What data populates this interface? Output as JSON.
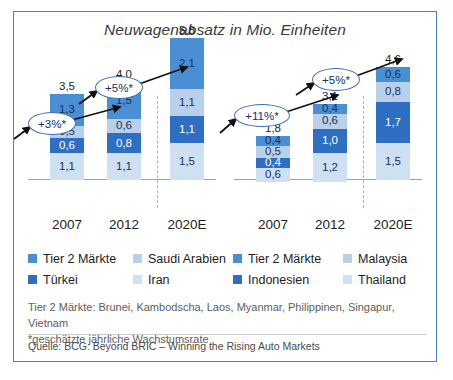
{
  "title": "Neuwagenabsatz in Mio. Einheiten",
  "colors": {
    "tier2": "#4a8fd4",
    "saudi": "#b9d0ea",
    "turkei": "#2e6fc4",
    "iran": "#cfe0f2",
    "tier2_r": "#4a8fd4",
    "malaysia": "#b9d0ea",
    "indonesien": "#2e6fc4",
    "thailand": "#cfe0f2",
    "frame": "#4f7fc0",
    "callout_border": "#3c6fb8"
  },
  "legend": {
    "columns": [
      {
        "items": [
          {
            "label": "Tier 2 Märkte",
            "color": "#4a8fd4"
          },
          {
            "label": "Türkei",
            "color": "#2e6fc4"
          }
        ]
      },
      {
        "items": [
          {
            "label": "Saudi Arabien",
            "color": "#b9d0ea"
          },
          {
            "label": "Iran",
            "color": "#cfe0f2"
          }
        ]
      },
      {
        "items": [
          {
            "label": "Tier 2 Märkte",
            "color": "#4a8fd4"
          },
          {
            "label": "Indonesien",
            "color": "#2e6fc4"
          }
        ]
      },
      {
        "items": [
          {
            "label": "Malaysia",
            "color": "#b9d0ea"
          },
          {
            "label": "Thailand",
            "color": "#cfe0f2"
          }
        ]
      }
    ]
  },
  "notes": {
    "line1": "Tier 2 Märkte: Brunei, Kambodscha, Laos, Myanmar, Philippinen, Singapur, Vietnam",
    "line2": "*geschätzte jährliche Wachstumsrate"
  },
  "source": "Quelle: BCG: Beyond BRIC – Winning the Rising Auto Markets",
  "callouts": {
    "left_first": "+3%*",
    "left_second": "+5%*",
    "right_first": "+11%*",
    "right_second": "+5%*"
  },
  "chart_data": [
    {
      "type": "bar",
      "title": "Neuwagenabsatz in Mio. Einheiten",
      "subtitle": "Naher Osten / Tier 2 Märkte",
      "stacked": true,
      "xlabel": "",
      "ylabel": "Mio. Einheiten",
      "ylim": [
        0,
        5.8
      ],
      "grid": false,
      "legend_position": "bottom",
      "categories": [
        "2007",
        "2012",
        "2020E"
      ],
      "totals": [
        "3,5",
        "4,0",
        "5,8"
      ],
      "totals_numeric": [
        3.5,
        4.0,
        5.8
      ],
      "series": [
        {
          "name": "Tier 2 Märkte",
          "color": "#4a8fd4",
          "labels": [
            "1,3",
            "1,5",
            "2,1"
          ],
          "values": [
            1.3,
            1.5,
            2.1
          ]
        },
        {
          "name": "Saudi Arabien",
          "color": "#b9d0ea",
          "labels": [
            "0,5",
            "0,6",
            "1,1"
          ],
          "values": [
            0.5,
            0.6,
            1.1
          ]
        },
        {
          "name": "Türkei",
          "color": "#2e6fc4",
          "labels": [
            "0,6",
            "0,8",
            "1,1"
          ],
          "values": [
            0.6,
            0.8,
            1.1
          ]
        },
        {
          "name": "Iran",
          "color": "#cfe0f2",
          "labels": [
            "1,1",
            "1,1",
            "1,5"
          ],
          "values": [
            1.1,
            1.1,
            1.5
          ]
        }
      ],
      "annotations": [
        {
          "text": "+3%*",
          "between": [
            "2007",
            "2012"
          ]
        },
        {
          "text": "+5%*",
          "between": [
            "2012",
            "2020E"
          ]
        }
      ]
    },
    {
      "type": "bar",
      "title": "Neuwagenabsatz in Mio. Einheiten",
      "subtitle": "ASEAN / Tier 2 Märkte",
      "stacked": true,
      "xlabel": "",
      "ylabel": "Mio. Einheiten",
      "ylim": [
        0,
        4.6
      ],
      "grid": false,
      "legend_position": "bottom",
      "categories": [
        "2007",
        "2012",
        "2020E"
      ],
      "totals": [
        "1,8",
        "3,1",
        "4,6"
      ],
      "totals_numeric": [
        1.8,
        3.1,
        4.6
      ],
      "series": [
        {
          "name": "Tier 2 Märkte",
          "color": "#4a8fd4",
          "labels": [
            "0,4",
            "0,4",
            "0,6"
          ],
          "values": [
            0.4,
            0.4,
            0.6
          ]
        },
        {
          "name": "Malaysia",
          "color": "#b9d0ea",
          "labels": [
            "0,5",
            "0,6",
            "0,8"
          ],
          "values": [
            0.5,
            0.6,
            0.8
          ]
        },
        {
          "name": "Indonesien",
          "color": "#2e6fc4",
          "labels": [
            "0,4",
            "1,0",
            "1,7"
          ],
          "values": [
            0.4,
            1.0,
            1.7
          ]
        },
        {
          "name": "Thailand",
          "color": "#cfe0f2",
          "labels": [
            "0,6",
            "1,2",
            "1,5"
          ],
          "values": [
            0.6,
            1.2,
            1.5
          ]
        }
      ],
      "annotations": [
        {
          "text": "+11%*",
          "between": [
            "2007",
            "2012"
          ]
        },
        {
          "text": "+5%*",
          "between": [
            "2012",
            "2020E"
          ]
        }
      ]
    }
  ]
}
